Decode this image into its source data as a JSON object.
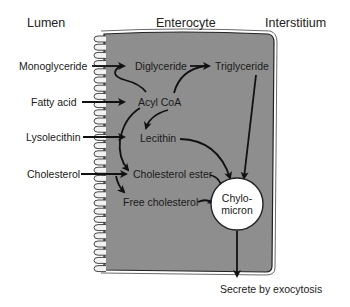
{
  "headers": {
    "lumen": "Lumen",
    "enterocyte": "Enterocyte",
    "interstitium": "Interstitium"
  },
  "lumen_inputs": [
    {
      "label": "Monoglyceride"
    },
    {
      "label": "Fatty acid"
    },
    {
      "label": "Lysolecithin"
    },
    {
      "label": "Cholesterol"
    }
  ],
  "intracellular": {
    "diglyceride": "Diglyceride",
    "triglyceride": "Triglyceride",
    "acyl_coa": "Acyl CoA",
    "lecithin": "Lecithin",
    "cholesterol_ester": "Cholesterol ester",
    "free_cholesterol": "Free cholesterol"
  },
  "chylomicron": {
    "line1": "Chylo-",
    "line2": "micron"
  },
  "output": {
    "label": "Secrete by exocytosis"
  },
  "colors": {
    "cytoplasm": "#8c8c8c",
    "membrane": "#ffffff",
    "arrow": "#111111",
    "chylomicron_fill": "#ffffff"
  }
}
